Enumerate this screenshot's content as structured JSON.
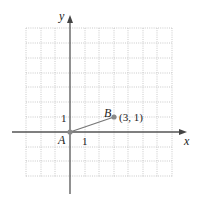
{
  "diagram": {
    "axes": {
      "x_label": "x",
      "y_label": "y"
    },
    "ticks": {
      "x_one": "1",
      "y_one": "1"
    },
    "points": [
      {
        "name": "A",
        "x": 0,
        "y": 0
      },
      {
        "name": "B",
        "x": 3,
        "y": 1,
        "coord_label": "(3, 1)"
      }
    ],
    "segment": {
      "from": "A",
      "to": "B"
    },
    "grid": {
      "x_min": -3,
      "x_max": 7,
      "y_min": -3,
      "y_max": 7
    },
    "colors": {
      "axis": "#555555",
      "grid": "#bbbbbb",
      "segment": "#777777",
      "point": "#888888"
    }
  }
}
